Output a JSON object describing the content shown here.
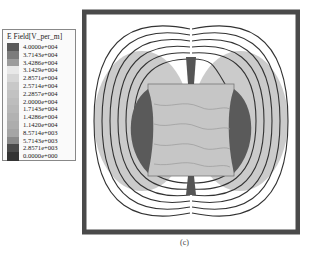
{
  "legend": {
    "title": "E Field[V_per_m]",
    "entries": [
      {
        "label": "4.0000e+004",
        "color": "#5a5a5a"
      },
      {
        "label": "3.7143e+004",
        "color": "#7c7c7c"
      },
      {
        "label": "3.4286e+004",
        "color": "#9c9c9c"
      },
      {
        "label": "3.1429e+004",
        "color": "#e8e8e8"
      },
      {
        "label": "2.8571e+004",
        "color": "#d6d6d6"
      },
      {
        "label": "2.5714e+004",
        "color": "#c8c8c8"
      },
      {
        "label": "2.2857e+004",
        "color": "#c2c2c2"
      },
      {
        "label": "2.0000e+004",
        "color": "#bdbdbd"
      },
      {
        "label": "1.7143e+004",
        "color": "#b8b8b8"
      },
      {
        "label": "1.4286e+004",
        "color": "#b2b2b2"
      },
      {
        "label": "1.1420e+004",
        "color": "#adadad"
      },
      {
        "label": "8.5714e+003",
        "color": "#a5a5a5"
      },
      {
        "label": "5.7143e+003",
        "color": "#8a8a8a"
      },
      {
        "label": "2.8571e+003",
        "color": "#4a4a4a"
      },
      {
        "label": "0.0000e+000",
        "color": "#333333"
      }
    ]
  },
  "figure": {
    "caption": "(c)"
  }
}
